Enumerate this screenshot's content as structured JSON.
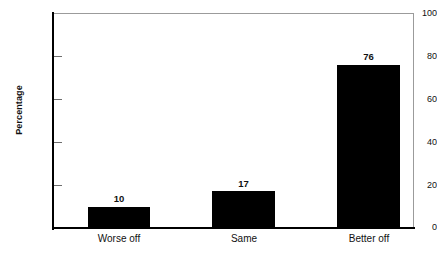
{
  "chart_data": {
    "type": "bar",
    "title": "",
    "xlabel": "",
    "ylabel": "Percentage",
    "categories": [
      "Worse off",
      "Same",
      "Better off"
    ],
    "values": [
      10,
      17,
      76
    ],
    "value_labels": [
      "10",
      "17",
      "76"
    ],
    "ylim": [
      0,
      100
    ],
    "yticks": [
      0,
      20,
      40,
      60,
      80,
      100
    ],
    "ytick_labels": [
      "0",
      "20",
      "40",
      "60",
      "80",
      "100"
    ],
    "grid": false,
    "legend": null,
    "series": [
      {
        "name": "Percentage",
        "values": [
          10,
          17,
          76
        ]
      }
    ],
    "colors": {
      "bar": "#000000",
      "axis": "#000000",
      "frame": "#9b9b9b",
      "text": "#111111",
      "background": "#ffffff"
    }
  }
}
